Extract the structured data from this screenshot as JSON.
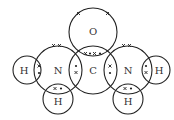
{
  "diagram": {
    "atoms": [
      {
        "id": "O",
        "label": "O",
        "cx": 93,
        "cy": 32,
        "r": 24
      },
      {
        "id": "C",
        "label": "C",
        "cx": 93,
        "cy": 70,
        "r": 24
      },
      {
        "id": "N1",
        "label": "N",
        "cx": 58,
        "cy": 70,
        "r": 24
      },
      {
        "id": "N2",
        "label": "N",
        "cx": 128,
        "cy": 70,
        "r": 24
      },
      {
        "id": "H1",
        "label": "H",
        "cx": 27,
        "cy": 70,
        "r": 14
      },
      {
        "id": "H2",
        "label": "H",
        "cx": 156,
        "cy": 70,
        "r": 14
      },
      {
        "id": "H3",
        "label": "H",
        "cx": 58,
        "cy": 99,
        "r": 15
      },
      {
        "id": "H4",
        "label": "H",
        "cx": 128,
        "cy": 99,
        "r": 15
      }
    ],
    "bonds": [
      {
        "between": [
          "C",
          "O"
        ],
        "type": "double",
        "electrons": "x•x•"
      },
      {
        "between": [
          "N1",
          "C"
        ],
        "type": "single",
        "electrons": "•x"
      },
      {
        "between": [
          "C",
          "N2"
        ],
        "type": "single",
        "electrons": "x•"
      },
      {
        "between": [
          "H1",
          "N1"
        ],
        "type": "single",
        "electrons": "x•"
      },
      {
        "between": [
          "N2",
          "H2"
        ],
        "type": "single",
        "electrons": "•x"
      },
      {
        "between": [
          "N1",
          "H3"
        ],
        "type": "single",
        "electrons": "x•"
      },
      {
        "between": [
          "N2",
          "H4"
        ],
        "type": "single",
        "electrons": "x•"
      }
    ],
    "lone_pairs": [
      {
        "atom": "O",
        "count": 2,
        "symbol": "x"
      },
      {
        "atom": "N1",
        "count": 1,
        "symbol": "x"
      },
      {
        "atom": "N2",
        "count": 1,
        "symbol": "x"
      }
    ]
  }
}
